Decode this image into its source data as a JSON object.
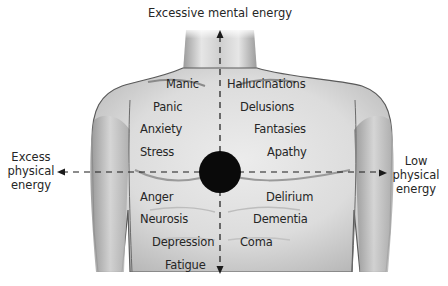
{
  "axes": {
    "top": "Excessive mental energy",
    "left": [
      "Excess",
      "physical",
      "energy"
    ],
    "right": [
      "Low",
      "physical",
      "energy"
    ]
  },
  "quadrants": {
    "upper_left": [
      "Manic",
      "Panic",
      "Anxiety",
      "Stress"
    ],
    "upper_right": [
      "Hallucinations",
      "Delusions",
      "Fantasies",
      "Apathy"
    ],
    "lower_left": [
      "Anger",
      "Neurosis",
      "Depression",
      "Fatigue"
    ],
    "lower_right": [
      "Delirium",
      "Dementia",
      "Coma"
    ]
  },
  "colors": {
    "center_dot": "#0a0a0a",
    "skin_light": "#e4e4e4",
    "skin_shadow": "#a9a9a9",
    "outline": "#5a5a5a",
    "text": "#262626"
  }
}
